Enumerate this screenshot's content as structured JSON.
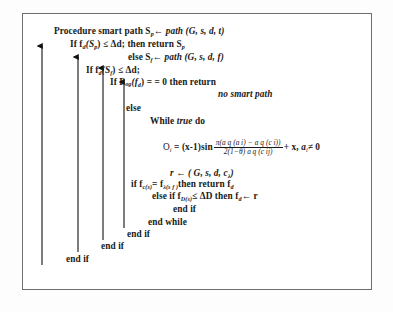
{
  "figure": {
    "kind": "algorithm-pseudocode-block",
    "title": "Procedure smart path",
    "border_color": "#6e6e72",
    "text_color": "#1a1a1a",
    "background": "#ffffff"
  },
  "code": {
    "line_1": "Procedure smart path S",
    "line_1_sub": "p",
    "line_1_rest": "path (G, s, d, t)",
    "line_2_a": "If f",
    "line_2_sub1": "d",
    "line_2_b": "(S",
    "line_2_sub2": "p",
    "line_2_c": ") ≤ Δd; then return S",
    "line_2_sub3": "p",
    "line_3_a": "else S",
    "line_3_sub": "f",
    "line_3_b": "path (G, s, d, f)",
    "line_4_a": "If f",
    "line_4_sub1": "d",
    "line_4_b": "(S",
    "line_4_sub2": "f",
    "line_4_c": ") ≤ Δd;",
    "line_5_a": "If P",
    "line_5_sub1": "og",
    "line_5_b": "(f",
    "line_5_sub2": "d",
    "line_5_c": ") = = 0 then return",
    "line_6": "no smart path",
    "line_7": "else",
    "line_8_a": "While",
    "line_8_it": "true",
    "line_8_b": "do",
    "formula": {
      "lhs": "O",
      "lhs_sub": "i",
      "eq": "= (x-1)sin",
      "numerator": "π(a q (a i) − a q (c i))",
      "denominator": "2(1−θ) a q (c ij)",
      "tail": "+ x,",
      "condition": "a",
      "condition_sub": "i",
      "condition_rest": "≠ 0"
    },
    "line_10_a": "r",
    "line_10_b": "( G, s, d, c",
    "line_10_sub": "λ",
    "line_10_c": ")",
    "line_11_a": "if f",
    "line_11_sub1": "c(s)",
    "line_11_b": "= f",
    "line_11_sub2": "λ(s f )",
    "line_11_c": "then return f",
    "line_11_sub3": "d",
    "line_12_a": "else if f",
    "line_12_sub1": "D(s)",
    "line_12_b": "≤ ΔD then f",
    "line_12_sub2": "d",
    "line_12_c": "r",
    "line_13": "end if",
    "line_14": "end while",
    "line_15": "end if",
    "line_16": "end if",
    "line_17": "end if",
    "arrow_symbol": "←"
  },
  "arrows": [
    {
      "name": "block-link-outer",
      "x": 42,
      "top": 44,
      "bottom": 265
    },
    {
      "name": "block-link-second",
      "x": 78,
      "top": 55,
      "bottom": 252
    },
    {
      "name": "block-link-third",
      "x": 103,
      "top": 66,
      "bottom": 240
    },
    {
      "name": "block-link-inner",
      "x": 124,
      "top": 80,
      "bottom": 228
    }
  ]
}
